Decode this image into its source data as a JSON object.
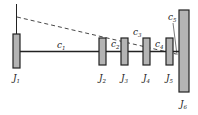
{
  "diagram": {
    "title": "",
    "inertias": [
      {
        "id": "J1",
        "symbol": "J",
        "subscript": "1"
      },
      {
        "id": "J2",
        "symbol": "J",
        "subscript": "2"
      },
      {
        "id": "J3",
        "symbol": "J",
        "subscript": "3"
      },
      {
        "id": "J4",
        "symbol": "J",
        "subscript": "4"
      },
      {
        "id": "J5",
        "symbol": "J",
        "subscript": "5"
      },
      {
        "id": "J6",
        "symbol": "J",
        "subscript": "6"
      }
    ],
    "stiffnesses": [
      {
        "id": "c1",
        "symbol": "c",
        "subscript": "1",
        "between": [
          "J1",
          "J2"
        ]
      },
      {
        "id": "c2",
        "symbol": "c",
        "subscript": "2",
        "between": [
          "J2",
          "J3"
        ]
      },
      {
        "id": "c3",
        "symbol": "c",
        "subscript": "3",
        "between": [
          "J3",
          "J4"
        ]
      },
      {
        "id": "c4",
        "symbol": "c",
        "subscript": "4",
        "between": [
          "J4",
          "J5"
        ]
      },
      {
        "id": "c5",
        "symbol": "c",
        "subscript": "5",
        "between": [
          "J5",
          "J6"
        ]
      }
    ],
    "colors": {
      "disk_fill": "#b4b4b4",
      "stroke": "#222222",
      "dashed": "#333333"
    }
  }
}
